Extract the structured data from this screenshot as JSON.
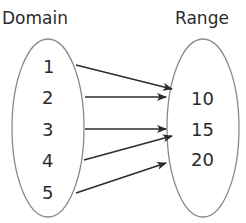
{
  "diagram": {
    "type": "mapping",
    "domain": {
      "label": "Domain",
      "values": [
        "1",
        "2",
        "3",
        "4",
        "5"
      ]
    },
    "range": {
      "label": "Range",
      "values": [
        "10",
        "15",
        "20"
      ]
    },
    "mappings": [
      {
        "from": "1",
        "to": "10"
      },
      {
        "from": "2",
        "to": "10"
      },
      {
        "from": "3",
        "to": "15"
      },
      {
        "from": "4",
        "to": "15"
      },
      {
        "from": "5",
        "to": "20"
      }
    ],
    "colors": {
      "text": "#2b2b2b",
      "oval_stroke": "#8a8a8a",
      "arrow": "#2b2b2b",
      "background": "#ffffff"
    }
  }
}
